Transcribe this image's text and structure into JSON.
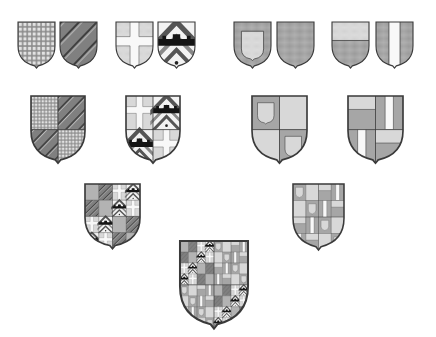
{
  "figure": {
    "background": "#ffffff",
    "colors": {
      "outline": "#3a3a3a",
      "dark": "#6e6e6e",
      "mid": "#a3a3a3",
      "light": "#d9d9d9",
      "white": "#f6f6f6",
      "black": "#1a1a1a"
    }
  },
  "rows": [
    {
      "row": 1,
      "groups": [
        {
          "name": "pair-1",
          "shields": [
            {
              "id": "chequy",
              "pattern": "checked grid"
            },
            {
              "id": "bendy",
              "pattern": "diagonal bends"
            }
          ]
        },
        {
          "name": "pair-2",
          "shields": [
            {
              "id": "cross",
              "pattern": "white cross on light field"
            },
            {
              "id": "chevronny-fess",
              "pattern": "chevrons with black embattled fess"
            }
          ]
        },
        {
          "name": "pair-3",
          "shields": [
            {
              "id": "inescutcheon",
              "pattern": "light inescutcheon on mid field"
            },
            {
              "id": "plain-mid",
              "pattern": "plain mid field"
            }
          ]
        },
        {
          "name": "pair-4",
          "shields": [
            {
              "id": "chief",
              "pattern": "light chief over mid field"
            },
            {
              "id": "pale",
              "pattern": "white pale on mid field"
            }
          ]
        }
      ]
    },
    {
      "row": 2,
      "shields": [
        {
          "id": "quartered-1",
          "combines": "pair-1"
        },
        {
          "id": "quartered-2",
          "combines": "pair-2"
        },
        {
          "id": "quartered-3",
          "combines": "pair-3"
        },
        {
          "id": "quartered-4",
          "combines": "pair-4"
        }
      ]
    },
    {
      "row": 3,
      "shields": [
        {
          "id": "grand-quartered-left",
          "combines": "quartered-1 + quartered-2"
        },
        {
          "id": "grand-quartered-right",
          "combines": "quartered-3 + quartered-4"
        }
      ]
    },
    {
      "row": 4,
      "shields": [
        {
          "id": "final-combined",
          "combines": "grand-quartered-left + grand-quartered-right"
        }
      ]
    }
  ]
}
